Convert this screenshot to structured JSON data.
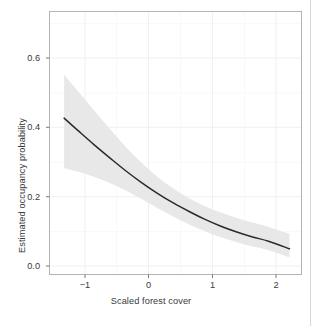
{
  "chart_data": {
    "type": "line",
    "title": "",
    "subtitle": "",
    "xlabel": "Scaled forest cover",
    "ylabel": "Estimated occupancy probability",
    "xlim": [
      -1.45,
      2.52
    ],
    "ylim": [
      -0.035,
      0.7
    ],
    "xticks": [
      -1,
      0,
      1,
      2
    ],
    "xticklabels": [
      "−1",
      "0",
      "1",
      "2"
    ],
    "yticks": [
      0.0,
      0.2,
      0.4,
      0.6
    ],
    "yticklabels": [
      "0.0",
      "0.2",
      "0.4",
      "0.6"
    ],
    "grid": true,
    "grid_minor": true,
    "legend": "none",
    "series": [
      {
        "name": "Estimated occupancy probability",
        "kind": "line",
        "color": "#2b2b2b",
        "x": [
          -1.22,
          -1.0,
          -0.75,
          -0.5,
          -0.25,
          0.0,
          0.25,
          0.5,
          0.75,
          1.0,
          1.25,
          1.5,
          1.75,
          2.0,
          2.33
        ],
        "y": [
          0.402,
          0.367,
          0.328,
          0.291,
          0.255,
          0.222,
          0.192,
          0.165,
          0.141,
          0.119,
          0.1,
          0.084,
          0.07,
          0.058,
          0.037
        ]
      },
      {
        "name": "95% confidence ribbon upper",
        "kind": "ribbon-upper",
        "color": "#e8e8e8",
        "x": [
          -1.22,
          -1.0,
          -0.75,
          -0.5,
          -0.25,
          0.0,
          0.25,
          0.5,
          0.75,
          1.0,
          1.25,
          1.5,
          1.75,
          2.0,
          2.33
        ],
        "y": [
          0.523,
          0.477,
          0.424,
          0.372,
          0.322,
          0.277,
          0.238,
          0.205,
          0.178,
          0.156,
          0.138,
          0.123,
          0.11,
          0.098,
          0.079
        ]
      },
      {
        "name": "95% confidence ribbon lower",
        "kind": "ribbon-lower",
        "color": "#e8e8e8",
        "x": [
          -1.22,
          -1.0,
          -0.75,
          -0.5,
          -0.25,
          0.0,
          0.25,
          0.5,
          0.75,
          1.0,
          1.25,
          1.5,
          1.75,
          2.0,
          2.33
        ],
        "y": [
          0.262,
          0.252,
          0.238,
          0.221,
          0.2,
          0.176,
          0.151,
          0.127,
          0.105,
          0.086,
          0.069,
          0.055,
          0.043,
          0.033,
          0.013
        ]
      }
    ]
  },
  "axes": {
    "x_title": "Scaled forest cover",
    "y_title": "Estimated occupancy probability",
    "x_tick_labels": [
      "−1",
      "0",
      "1",
      "2"
    ],
    "y_tick_labels": [
      "0.0",
      "0.2",
      "0.4",
      "0.6"
    ]
  },
  "style": {
    "panel_background": "#ffffff",
    "panel_border": "#b4b4b4",
    "grid_color": "#f2f2f2",
    "ribbon_color": "#e9e9e9",
    "line_color": "#2b2b2b",
    "text_color": "#3a3a3a"
  }
}
